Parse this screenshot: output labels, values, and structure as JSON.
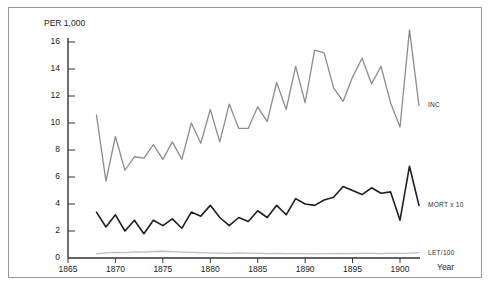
{
  "figure": {
    "scan_artifact_text": "",
    "y_axis_unit_label": "PER 1,000",
    "x_axis_title": "Year"
  },
  "chart_data": {
    "type": "line",
    "title": "",
    "subtitle": "",
    "xlabel": "Year",
    "ylabel": "PER 1,000",
    "xlim": [
      1865,
      1903
    ],
    "ylim": [
      0,
      17
    ],
    "grid": false,
    "legend_position": "right-inline",
    "x_ticks": [
      1865,
      1870,
      1875,
      1880,
      1885,
      1890,
      1895,
      1900
    ],
    "y_ticks": [
      0,
      2,
      4,
      6,
      8,
      10,
      12,
      14,
      16
    ],
    "x": [
      1868,
      1869,
      1870,
      1871,
      1872,
      1873,
      1874,
      1875,
      1876,
      1877,
      1878,
      1879,
      1880,
      1881,
      1882,
      1883,
      1884,
      1885,
      1886,
      1887,
      1888,
      1889,
      1890,
      1891,
      1892,
      1893,
      1894,
      1895,
      1896,
      1897,
      1898,
      1899,
      1900,
      1901,
      1902
    ],
    "series": [
      {
        "name": "INC",
        "label": "INC",
        "color": "#8c8c8c",
        "values": [
          10.6,
          5.7,
          9.0,
          6.5,
          7.5,
          7.4,
          8.4,
          7.3,
          8.6,
          7.3,
          10.0,
          8.5,
          11.0,
          8.6,
          11.4,
          9.6,
          9.6,
          11.2,
          10.1,
          13.0,
          11.0,
          14.2,
          11.5,
          15.4,
          15.2,
          12.6,
          11.6,
          13.4,
          14.8,
          12.9,
          14.2,
          11.5,
          9.7,
          16.9,
          11.3
        ]
      },
      {
        "name": "MORT x 10",
        "label": "MORT x 10",
        "color": "#1f1f1f",
        "values": [
          3.4,
          2.3,
          3.2,
          2.0,
          2.8,
          1.8,
          2.8,
          2.4,
          2.9,
          2.2,
          3.4,
          3.1,
          3.9,
          3.0,
          2.4,
          3.0,
          2.7,
          3.5,
          3.0,
          3.9,
          3.2,
          4.4,
          4.0,
          3.9,
          4.3,
          4.5,
          5.3,
          5.0,
          4.7,
          5.2,
          4.8,
          4.9,
          2.8,
          6.8,
          3.9
        ]
      },
      {
        "name": "LET/100",
        "label": "LET/100",
        "color": "#bdbdbd",
        "values": [
          0.3,
          0.38,
          0.42,
          0.4,
          0.45,
          0.43,
          0.48,
          0.5,
          0.47,
          0.44,
          0.42,
          0.4,
          0.38,
          0.36,
          0.35,
          0.37,
          0.36,
          0.34,
          0.33,
          0.34,
          0.33,
          0.32,
          0.33,
          0.31,
          0.32,
          0.33,
          0.34,
          0.33,
          0.35,
          0.34,
          0.33,
          0.35,
          0.34,
          0.36,
          0.4
        ]
      }
    ]
  }
}
